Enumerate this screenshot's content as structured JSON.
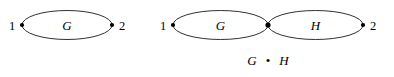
{
  "figure": {
    "background_color": "#ffffff",
    "stroke_color": "#1a1a1a",
    "vertex_color": "#000000",
    "text_color": "#000000",
    "width": 394,
    "height": 77
  },
  "diagram_left": {
    "name": "single-edge-graph-G",
    "terminal_start_label": "1",
    "terminal_end_label": "2",
    "edges": [
      {
        "label": "G",
        "from": "1",
        "to": "2"
      }
    ],
    "vertex_count": 2,
    "edge_count": 1
  },
  "diagram_right": {
    "name": "series-composition-G-H",
    "terminal_start_label": "1",
    "terminal_end_label": "2",
    "edges": [
      {
        "label": "G",
        "from": "1",
        "to": "mid"
      },
      {
        "label": "H",
        "from": "mid",
        "to": "2"
      }
    ],
    "vertex_count": 3,
    "edge_count": 2,
    "caption": {
      "left_operand": "G",
      "operator": "•",
      "right_operand": "H",
      "full_text": "G • H"
    }
  }
}
